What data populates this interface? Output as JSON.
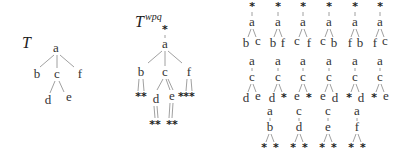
{
  "tree_T": {
    "title": "T",
    "nodes": {
      "a": "a",
      "b": "b",
      "c": "c",
      "f": "f",
      "d": "d",
      "e": "e"
    }
  },
  "tree_Twpq": {
    "title": "T",
    "superscript": "wpq",
    "root_marker": "*",
    "nodes": {
      "a": "a",
      "b": "b",
      "c": "c",
      "f": "f",
      "d": "d",
      "e": "e"
    },
    "b_children": "**",
    "f_children": "**",
    "e_extra": "*",
    "d_children": "**",
    "e_children": "**"
  },
  "fragments_row1": [
    {
      "top": "*",
      "root": "a",
      "left": "b",
      "right": "c"
    },
    {
      "top": "*",
      "root": "a",
      "left": "b",
      "right": "f"
    },
    {
      "top": "*",
      "root": "a",
      "left": "c",
      "right": "f"
    },
    {
      "top": "*",
      "root": "a",
      "left": "c",
      "right": "b"
    },
    {
      "top": "*",
      "root": "a",
      "left": "f",
      "right": "b"
    },
    {
      "top": "*",
      "root": "a",
      "left": "f",
      "right": "c"
    }
  ],
  "fragments_row2": [
    {
      "top": "a",
      "root": "c",
      "left": "d",
      "right": "e"
    },
    {
      "top": "a",
      "root": "c",
      "left": "d",
      "right": "*"
    },
    {
      "top": "a",
      "root": "c",
      "left": "e",
      "right": "*"
    },
    {
      "top": "a",
      "root": "c",
      "left": "e",
      "right": "d"
    },
    {
      "top": "a",
      "root": "c",
      "left": "*",
      "right": "d"
    },
    {
      "top": "a",
      "root": "c",
      "left": "*",
      "right": "e"
    }
  ],
  "fragments_row3": [
    {
      "top": "a",
      "root": "b",
      "left": "*",
      "right": "*"
    },
    {
      "top": "c",
      "root": "d",
      "left": "*",
      "right": "*"
    },
    {
      "top": "c",
      "root": "e",
      "left": "*",
      "right": "*"
    },
    {
      "top": "a",
      "root": "f",
      "left": "*",
      "right": "*"
    }
  ]
}
